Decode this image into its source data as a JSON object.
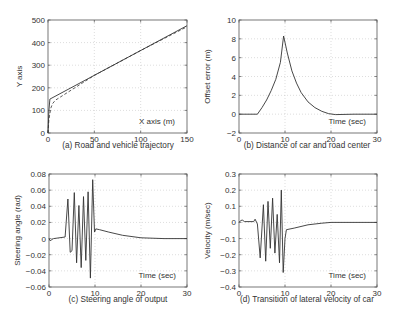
{
  "chart_data": [
    {
      "id": "a",
      "type": "line",
      "caption": "(a) Road and vehicle trajectory",
      "xlabel": "X axis (m)",
      "ylabel": "Y axis",
      "xlim": [
        0,
        150
      ],
      "ylim": [
        0,
        500
      ],
      "xticks": [
        0,
        50,
        100,
        150
      ],
      "yticks": [
        0,
        100,
        200,
        300,
        400,
        500
      ],
      "grid": true,
      "series": [
        {
          "name": "road",
          "style": "solid",
          "x": [
            0,
            1,
            2,
            150
          ],
          "y": [
            0,
            100,
            150,
            475
          ]
        },
        {
          "name": "vehicle",
          "style": "dashed",
          "x": [
            0,
            1,
            3,
            5,
            8,
            50,
            100,
            150
          ],
          "y": [
            0,
            60,
            110,
            130,
            145,
            255,
            365,
            470
          ]
        }
      ]
    },
    {
      "id": "b",
      "type": "line",
      "caption": "(b) Distance of car and road center",
      "xlabel": "Time (sec)",
      "ylabel": "Offset error (m)",
      "xlim": [
        0,
        30
      ],
      "ylim": [
        -2,
        10
      ],
      "xticks": [
        0,
        10,
        20,
        30
      ],
      "yticks": [
        -2,
        0,
        2,
        4,
        6,
        8,
        10
      ],
      "grid": true,
      "series": [
        {
          "name": "offset",
          "x": [
            0,
            4,
            5,
            6,
            7,
            8,
            9,
            9.7,
            10.5,
            11.5,
            12.5,
            13.5,
            15,
            16.5,
            18,
            19.5,
            21,
            25,
            30
          ],
          "y": [
            0,
            0,
            0.7,
            1.5,
            2.5,
            3.7,
            5.5,
            8.3,
            6.5,
            4.6,
            3.3,
            2.3,
            1.3,
            0.7,
            0.3,
            0.05,
            -0.05,
            0,
            0
          ]
        }
      ]
    },
    {
      "id": "c",
      "type": "line",
      "caption": "(c) Steering angle of output",
      "xlabel": "Time (sec)",
      "ylabel": "Steering angle (rad)",
      "xlim": [
        0,
        30
      ],
      "ylim": [
        -0.06,
        0.08
      ],
      "xticks": [
        0,
        10,
        20,
        30
      ],
      "yticks": [
        -0.06,
        -0.04,
        -0.02,
        0,
        0.02,
        0.04,
        0.06,
        0.08
      ],
      "grid": true,
      "series": [
        {
          "name": "steering",
          "x": [
            0,
            0.3,
            0.6,
            1,
            3.5,
            4.1,
            4.6,
            5.0,
            5.5,
            6.0,
            6.5,
            7.0,
            7.5,
            8.0,
            8.5,
            9.0,
            9.5,
            9.9,
            10.2,
            11,
            13,
            16,
            20,
            25,
            30
          ],
          "y": [
            0,
            -0.003,
            -0.001,
            0,
            0.002,
            0.049,
            -0.017,
            -0.015,
            0.057,
            -0.03,
            0.041,
            -0.036,
            0.052,
            -0.027,
            0.058,
            -0.049,
            0.073,
            0.008,
            0.012,
            0.011,
            0.008,
            0.004,
            0.001,
            0,
            0
          ]
        }
      ]
    },
    {
      "id": "d",
      "type": "line",
      "caption": "(d) Transition of lateral velocity of car",
      "xlabel": "Time (sec)",
      "ylabel": "Velocity (m/sec)",
      "xlim": [
        0,
        30
      ],
      "ylim": [
        -0.4,
        0.3
      ],
      "xticks": [
        0,
        10,
        20,
        30
      ],
      "yticks": [
        -0.4,
        -0.3,
        -0.2,
        -0.1,
        0,
        0.1,
        0.2,
        0.3
      ],
      "grid": true,
      "series": [
        {
          "name": "velocity",
          "x": [
            0,
            0.3,
            0.7,
            1.2,
            3.2,
            3.5,
            4.0,
            4.6,
            5.3,
            5.8,
            6.3,
            6.8,
            7.3,
            7.8,
            8.3,
            8.8,
            9.2,
            9.6,
            10.0,
            10.3,
            12,
            15,
            18,
            20,
            25,
            30
          ],
          "y": [
            0,
            0.01,
            0.015,
            0.005,
            0.005,
            0.02,
            -0.01,
            -0.22,
            0.11,
            -0.24,
            0.13,
            -0.16,
            0.15,
            -0.19,
            0.05,
            -0.25,
            0.2,
            -0.31,
            -0.1,
            -0.045,
            -0.035,
            -0.015,
            -0.005,
            0,
            0,
            0
          ]
        }
      ]
    }
  ],
  "panels": [
    {
      "caption": "(a) Road and vehicle trajectory",
      "xlabel": "X axis (m)",
      "ylabel": "Y axis"
    },
    {
      "caption": "(b) Distance of car and road center",
      "xlabel": "Time (sec)",
      "ylabel": "Offset error (m)"
    },
    {
      "caption": "(c) Steering angle of output",
      "xlabel": "Time (sec)",
      "ylabel": "Steering angle (rad)"
    },
    {
      "caption": "(d) Transition of lateral velocity of car",
      "xlabel": "Time (sec)",
      "ylabel": "Velocity (m/sec)"
    }
  ]
}
